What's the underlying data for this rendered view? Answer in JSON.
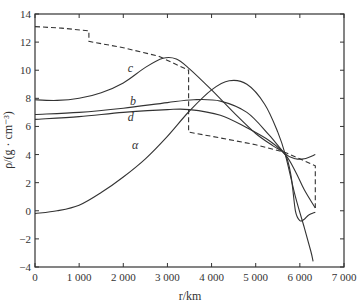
{
  "chart_data": {
    "type": "line",
    "title": "",
    "xlabel": "r/km",
    "ylabel": "ρ/(g · cm⁻³)",
    "xlim": [
      0,
      7000
    ],
    "ylim": [
      -4,
      14
    ],
    "xticks": [
      0,
      1000,
      2000,
      3000,
      4000,
      5000,
      6000,
      7000
    ],
    "xtick_labels": [
      "0",
      "1 000",
      "2 000",
      "3 000",
      "4 000",
      "5 000",
      "6 000",
      "7 000"
    ],
    "yticks": [
      -4,
      -2,
      0,
      2,
      4,
      6,
      8,
      10,
      12,
      14
    ],
    "ytick_labels": [
      "−4",
      "−2",
      "0",
      "2",
      "4",
      "6",
      "8",
      "10",
      "12",
      "14"
    ],
    "grid": false,
    "legend": "none (inline curve labels)",
    "series": [
      {
        "name": "reference (dashed)",
        "style": "dashed",
        "label": "",
        "points": [
          [
            0,
            13.1
          ],
          [
            600,
            13.0
          ],
          [
            1220,
            12.8
          ],
          [
            1220,
            12.05
          ],
          [
            2000,
            11.6
          ],
          [
            2800,
            11.0
          ],
          [
            3480,
            10.0
          ],
          [
            3480,
            5.6
          ],
          [
            4000,
            5.3
          ],
          [
            5000,
            4.7
          ],
          [
            5670,
            4.15
          ],
          [
            6000,
            3.7
          ],
          [
            6350,
            3.2
          ],
          [
            6350,
            0.2
          ]
        ]
      },
      {
        "name": "c",
        "style": "solid",
        "label": "c",
        "label_pos": [
          2100,
          9.9
        ],
        "points": [
          [
            0,
            7.9
          ],
          [
            500,
            7.85
          ],
          [
            1000,
            8.0
          ],
          [
            1500,
            8.4
          ],
          [
            2000,
            9.1
          ],
          [
            2500,
            10.2
          ],
          [
            2900,
            10.85
          ],
          [
            3200,
            10.8
          ],
          [
            3500,
            10.1
          ],
          [
            4000,
            8.6
          ],
          [
            4500,
            7.0
          ],
          [
            5000,
            5.5
          ],
          [
            5400,
            4.6
          ],
          [
            5670,
            4.0
          ],
          [
            5800,
            2.5
          ],
          [
            5900,
            0.0
          ],
          [
            6000,
            -0.7
          ],
          [
            6100,
            -0.6
          ],
          [
            6200,
            -0.3
          ],
          [
            6350,
            -0.1
          ]
        ]
      },
      {
        "name": "b",
        "style": "solid",
        "label": "b",
        "label_pos": [
          2150,
          7.5
        ],
        "points": [
          [
            0,
            6.85
          ],
          [
            1000,
            7.0
          ],
          [
            2000,
            7.3
          ],
          [
            3000,
            7.7
          ],
          [
            3600,
            7.9
          ],
          [
            4200,
            7.8
          ],
          [
            4800,
            7.0
          ],
          [
            5300,
            5.4
          ],
          [
            5670,
            4.05
          ],
          [
            5900,
            3.7
          ],
          [
            6100,
            3.7
          ],
          [
            6350,
            4.0
          ]
        ]
      },
      {
        "name": "d",
        "style": "solid",
        "label": "d",
        "label_pos": [
          2100,
          6.4
        ],
        "points": [
          [
            0,
            6.5
          ],
          [
            1000,
            6.7
          ],
          [
            2000,
            7.0
          ],
          [
            3000,
            7.2
          ],
          [
            3500,
            7.2
          ],
          [
            4200,
            6.8
          ],
          [
            4800,
            5.9
          ],
          [
            5300,
            5.0
          ],
          [
            5670,
            4.0
          ],
          [
            5900,
            2.8
          ],
          [
            6100,
            1.5
          ],
          [
            6350,
            0.2
          ]
        ]
      },
      {
        "name": "α",
        "style": "solid",
        "label": "α",
        "label_pos": [
          2200,
          4.4
        ],
        "points": [
          [
            0,
            -0.2
          ],
          [
            500,
            0.0
          ],
          [
            1000,
            0.4
          ],
          [
            1500,
            1.3
          ],
          [
            2000,
            2.4
          ],
          [
            2500,
            3.7
          ],
          [
            3000,
            5.3
          ],
          [
            3500,
            7.1
          ],
          [
            4000,
            8.6
          ],
          [
            4400,
            9.25
          ],
          [
            4800,
            9.0
          ],
          [
            5200,
            7.6
          ],
          [
            5500,
            5.6
          ],
          [
            5670,
            4.0
          ],
          [
            5900,
            1.0
          ],
          [
            6100,
            -1.2
          ],
          [
            6250,
            -2.9
          ],
          [
            6300,
            -3.6
          ]
        ]
      }
    ]
  }
}
